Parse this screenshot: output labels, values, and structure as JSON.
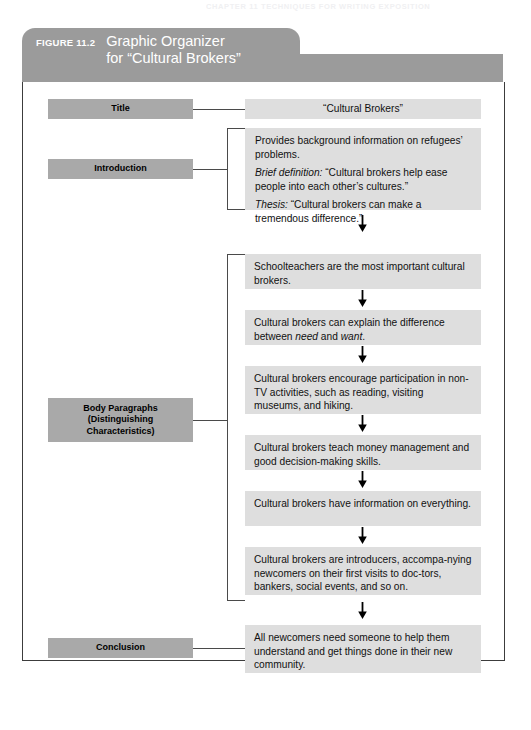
{
  "running_head": "CHAPTER 11   TECHNIQUES FOR WRITING EXPOSITION",
  "figure": {
    "label": "FIGURE 11.2",
    "title": "Graphic Organizer\nfor “Cultural Brokers”"
  },
  "colors": {
    "header_gray": "#9b9b9b",
    "label_gray": "#a9a9a9",
    "content_gray": "#dedede",
    "rule": "#4a4a4a",
    "frame": "#3c3c3c"
  },
  "rows": {
    "title": {
      "label": "Title",
      "content": "“Cultural Brokers”"
    },
    "introduction": {
      "label": "Introduction",
      "lines": [
        {
          "lead": "",
          "text": "Provides background information on refugees’ problems."
        },
        {
          "lead": "Brief definition:",
          "text": " “Cultural brokers help ease people into each other’s cultures.”"
        },
        {
          "lead": "Thesis:",
          "text": " “Cultural brokers can make a tremendous difference.”"
        }
      ]
    },
    "body": {
      "label": "Body Paragraphs\n(Distinguishing\nCharacteristics)",
      "items": [
        {
          "pre": "Schoolteachers are the most important cultural brokers.",
          "em": "",
          "post": ""
        },
        {
          "pre": "Cultural brokers can explain the difference between ",
          "em": "need",
          "mid": " and ",
          "em2": "want",
          "post": "."
        },
        {
          "pre": "Cultural brokers encourage participation in non-TV activities, such as reading, visiting museums, and hiking.",
          "em": "",
          "post": ""
        },
        {
          "pre": "Cultural brokers teach money management and good decision-making skills.",
          "em": "",
          "post": ""
        },
        {
          "pre": "Cultural brokers have information on everything.",
          "em": "",
          "post": ""
        },
        {
          "pre": "Cultural brokers are introducers, accompa-nying newcomers on their first visits to doc-tors, bankers, social events, and so on.",
          "em": "",
          "post": ""
        }
      ]
    },
    "conclusion": {
      "label": "Conclusion",
      "content": "All newcomers need someone to help them understand and get things done in their new community."
    }
  },
  "icons": {
    "arrow": "down-arrow-icon"
  }
}
